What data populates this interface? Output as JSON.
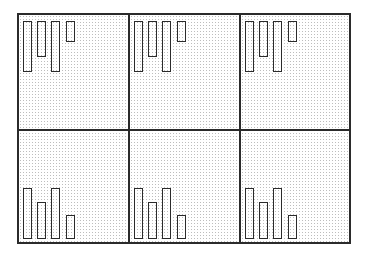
{
  "figure": {
    "rows": 2,
    "cols": 3
  },
  "chart_data": [
    {
      "type": "bar",
      "panel": "top-left",
      "orientation": "hanging-from-top",
      "categories": [
        "1",
        "2",
        "3",
        "4"
      ],
      "values": [
        51,
        36,
        51,
        21
      ]
    },
    {
      "type": "bar",
      "panel": "top-center",
      "orientation": "hanging-from-top",
      "categories": [
        "1",
        "2",
        "3",
        "4"
      ],
      "values": [
        51,
        36,
        51,
        21
      ]
    },
    {
      "type": "bar",
      "panel": "top-right",
      "orientation": "hanging-from-top",
      "categories": [
        "1",
        "2",
        "3",
        "4"
      ],
      "values": [
        51,
        36,
        51,
        21
      ]
    },
    {
      "type": "bar",
      "panel": "bottom-left",
      "orientation": "rising-from-bottom",
      "categories": [
        "1",
        "2",
        "3",
        "4"
      ],
      "values": [
        51,
        37,
        51,
        24
      ]
    },
    {
      "type": "bar",
      "panel": "bottom-center",
      "orientation": "rising-from-bottom",
      "categories": [
        "1",
        "2",
        "3",
        "4"
      ],
      "values": [
        51,
        37,
        51,
        24
      ]
    },
    {
      "type": "bar",
      "panel": "bottom-right",
      "orientation": "rising-from-bottom",
      "categories": [
        "1",
        "2",
        "3",
        "4"
      ],
      "values": [
        51,
        37,
        51,
        24
      ]
    }
  ],
  "colors": {
    "line": "#2b2b2b",
    "stipple": "#bdbdbd",
    "background": "#ffffff"
  }
}
